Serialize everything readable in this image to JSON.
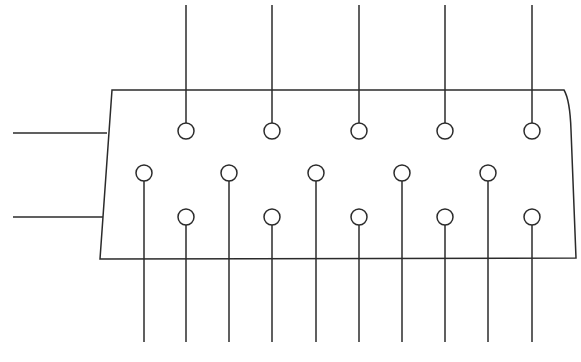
{
  "diagram": {
    "type": "connector-pinout",
    "stroke_color": "#2b2b2b",
    "background_color": "#ffffff",
    "body": {
      "shape": "trapezoid",
      "points": [
        [
          112,
          90
        ],
        [
          564,
          90
        ],
        [
          576,
          258
        ],
        [
          100,
          259
        ]
      ]
    },
    "side_leads": [
      {
        "y_start": 133,
        "y_end": 133,
        "x_start": 13,
        "x_end": 107
      },
      {
        "y_start": 217,
        "y_end": 217,
        "x_start": 13,
        "x_end": 103
      }
    ],
    "pin_radius": 8,
    "rows": [
      {
        "name": "top-row",
        "y": 131,
        "lead_direction": "up",
        "lead_end_y": 5,
        "pins_x": [
          186,
          272,
          359,
          445,
          532
        ]
      },
      {
        "name": "middle-row",
        "y": 173,
        "lead_direction": "down",
        "lead_end_y": 342,
        "pins_x": [
          144,
          229,
          316,
          402,
          488
        ]
      },
      {
        "name": "bottom-row",
        "y": 217,
        "lead_direction": "down",
        "lead_end_y": 342,
        "pins_x": [
          186,
          272,
          359,
          445,
          532
        ]
      }
    ]
  }
}
